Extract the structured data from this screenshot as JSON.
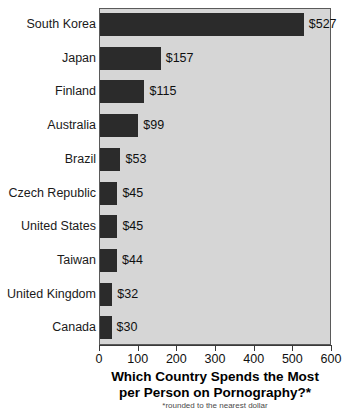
{
  "chart_data": {
    "type": "bar",
    "orientation": "horizontal",
    "title": "Which Country Spends the Most per Person on Pornography?*",
    "title_lines": [
      "Which Country Spends the Most",
      "per Person on Pornography?*"
    ],
    "footnote": "*rounded to the nearest dollar",
    "xlabel": "",
    "ylabel": "",
    "xlim": [
      0,
      600
    ],
    "xticks": [
      0,
      100,
      200,
      300,
      400,
      500,
      600
    ],
    "xtick_labels": [
      "0",
      "100",
      "200",
      "300",
      "400",
      "500",
      "600"
    ],
    "grid": false,
    "legend": false,
    "categories": [
      "South Korea",
      "Japan",
      "Finland",
      "Australia",
      "Brazil",
      "Czech Republic",
      "United States",
      "Taiwan",
      "United Kingdom",
      "Canada"
    ],
    "values": [
      527,
      157,
      115,
      99,
      53,
      45,
      45,
      44,
      32,
      30
    ],
    "value_labels": [
      "$527",
      "$157",
      "$115",
      "$99",
      "$53",
      "$45",
      "$45",
      "$44",
      "$32",
      "$30"
    ],
    "bar_color": "#2b2b2b",
    "plot_background": "#d6d6d6",
    "page_background": "#ffffff"
  }
}
